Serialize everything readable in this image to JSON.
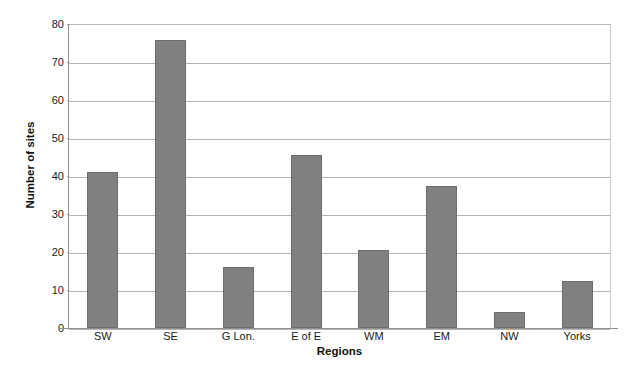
{
  "figure": {
    "panel_letter": "C",
    "accent_color": "#808080",
    "grid_color": "#b4b4b4",
    "axis_color": "#8f8f8f"
  },
  "chart_data": {
    "type": "bar",
    "title": "",
    "subtitle": "",
    "xlabel": "Regions",
    "ylabel": "Number of sites",
    "categories": [
      "SW",
      "SE",
      "G Lon.",
      "E of E",
      "WM",
      "EM",
      "NW",
      "Yorks"
    ],
    "values": [
      41,
      75.8,
      16,
      45.5,
      20.6,
      37.5,
      4.2,
      12.3
    ],
    "ylim": [
      0,
      80
    ],
    "ytick_values": [
      0,
      10,
      20,
      30,
      40,
      50,
      60,
      70,
      80
    ],
    "ytick_labels": [
      "0",
      "10",
      "20",
      "30",
      "40",
      "50",
      "60",
      "70",
      "80"
    ],
    "grid": "horizontal",
    "legend": "none",
    "annotations": [
      "C"
    ],
    "bar_color": "#808080"
  }
}
